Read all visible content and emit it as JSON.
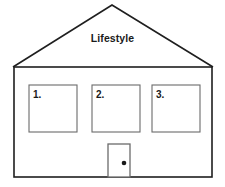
{
  "diagram": {
    "type": "house-outline-diagram",
    "title": "Lifestyle",
    "background_color": "#ffffff",
    "outline_color": "#1f1f1f",
    "window_border_color": "#6b6b6b",
    "door_border_color": "#6b6b6b",
    "knob_color": "#1a1a1a",
    "roof": {
      "label": "Lifestyle",
      "apex_x": 112,
      "apex_y": 5,
      "left_eave_x": 13,
      "left_eave_y": 67,
      "right_eave_x": 213,
      "right_eave_y": 67
    },
    "walls": {
      "left_x": 14,
      "right_x": 212,
      "top_y": 67,
      "bottom_y": 177
    },
    "windows": [
      {
        "label": "1.",
        "x": 29,
        "y": 85,
        "width": 48,
        "height": 47
      },
      {
        "label": "2.",
        "x": 92,
        "y": 85,
        "width": 48,
        "height": 47
      },
      {
        "label": "3.",
        "x": 152,
        "y": 85,
        "width": 48,
        "height": 47
      }
    ],
    "door": {
      "x": 108,
      "y": 144,
      "width": 22,
      "height": 33,
      "knob_x": 124,
      "knob_y": 163,
      "knob_radius": 2.3
    }
  }
}
